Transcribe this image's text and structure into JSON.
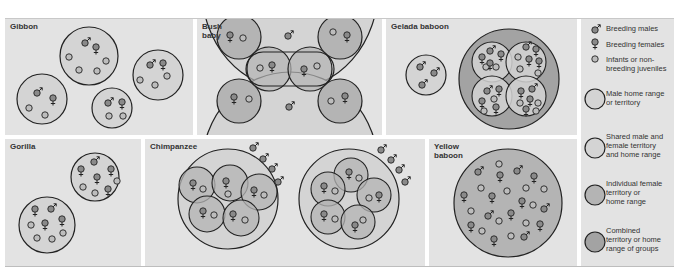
{
  "panels": {
    "gibbon": {
      "title": "Gibbon"
    },
    "bush_baby": {
      "title": "Bush\nbaby"
    },
    "gelada": {
      "title": "Gelada baboon"
    },
    "gorilla": {
      "title": "Gorilla"
    },
    "chimpanzee": {
      "title": "Chimpanzee"
    },
    "yellow_baboon": {
      "title": "Yellow\nbaboon"
    }
  },
  "legend": {
    "items": [
      {
        "icon": "male-symbol",
        "label": "Breeding males"
      },
      {
        "icon": "female-symbol",
        "label": "Breeding females"
      },
      {
        "icon": "small-circle",
        "label": "Infants or non-\nbreeding juveniles"
      },
      {
        "icon": "light-circle",
        "label": "Male home range\nor territory"
      },
      {
        "icon": "light-circle",
        "label": "Shared male and\nfemale territory\nand home range"
      },
      {
        "icon": "medium-circle",
        "label": "Individual female\nterritory or\nhome range"
      },
      {
        "icon": "dark-circle",
        "label": "Combined\nterritory or home\nrange of groups"
      }
    ]
  },
  "colors": {
    "panel_bg": "#e3e3e3",
    "light_fill": "#d4d4d4",
    "medium_fill": "#b4b4b4",
    "dark_fill": "#a3a3a3",
    "stroke": "#222222",
    "symbol_fill": "#8a8a8a"
  }
}
